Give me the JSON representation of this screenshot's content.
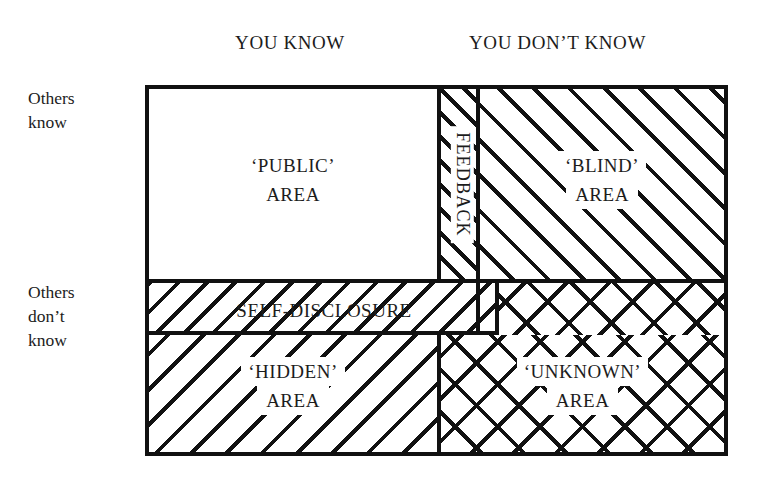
{
  "diagram": {
    "name": "Johari Window",
    "column_headers": [
      {
        "id": "you-know",
        "label": "YOU KNOW"
      },
      {
        "id": "you-dont-know",
        "label": "YOU DON’T KNOW"
      }
    ],
    "row_labels": [
      {
        "id": "others-know",
        "line1": "Others",
        "line2": "know"
      },
      {
        "id": "others-dont-know",
        "line1": "Others",
        "line2": "don’t",
        "line3": "know"
      }
    ],
    "quadrants": [
      {
        "id": "public",
        "line1": "‘PUBLIC’",
        "line2": "AREA",
        "fill": "none"
      },
      {
        "id": "blind",
        "line1": "‘BLIND’",
        "line2": "AREA",
        "fill": "diagonal-forward"
      },
      {
        "id": "hidden",
        "line1": "‘HIDDEN’",
        "line2": "AREA",
        "fill": "diagonal-backward"
      },
      {
        "id": "unknown",
        "line1": "‘UNKNOWN’",
        "line2": "AREA",
        "fill": "cross-hatch"
      }
    ],
    "bands": [
      {
        "id": "feedback",
        "label": "FEEDBACK",
        "orientation": "vertical",
        "fill": "diagonal-forward"
      },
      {
        "id": "self-disclosure",
        "label": "SELF-DISCLOSURE",
        "orientation": "horizontal",
        "fill": "diagonal-backward"
      }
    ],
    "colors": {
      "ink": "#111111",
      "text": "#1c1c1c",
      "background": "#ffffff"
    }
  }
}
